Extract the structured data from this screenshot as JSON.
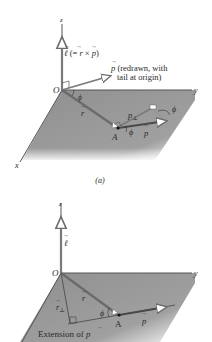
{
  "figure": {
    "panel_a": {
      "caption": "(a)",
      "axes": {
        "x": "x",
        "y": "y",
        "z": "z",
        "origin": "O"
      },
      "vectors": {
        "ell": {
          "symbol": "ℓ",
          "label_suffix": " (= ",
          "r": "r",
          "cross": " × ",
          "p": "p",
          "close": ")"
        },
        "p_redrawn": {
          "symbol": "p",
          "text_line1": " (redrawn, with",
          "text_line2": "tail at origin)"
        },
        "r": {
          "symbol": "r"
        },
        "p": {
          "symbol": "p"
        },
        "p_perp": {
          "symbol": "p",
          "subscript": "⊥"
        }
      },
      "point": "A",
      "angle": "ϕ"
    },
    "panel_b": {
      "axes": {
        "y": "y",
        "z": "z",
        "origin": "O"
      },
      "vectors": {
        "ell": {
          "symbol": "ℓ"
        },
        "r": {
          "symbol": "r"
        },
        "r_perp": {
          "symbol": "r",
          "subscript": "⊥"
        },
        "p": {
          "symbol": "p"
        }
      },
      "point": "A",
      "angle": "ϕ",
      "extension_label": "Extension of ",
      "extension_symbol": "p"
    },
    "colors": {
      "plane": "#9a9a9a",
      "vector": "#6b6b6b",
      "axis": "#555555",
      "text": "#2a2a2a"
    }
  }
}
